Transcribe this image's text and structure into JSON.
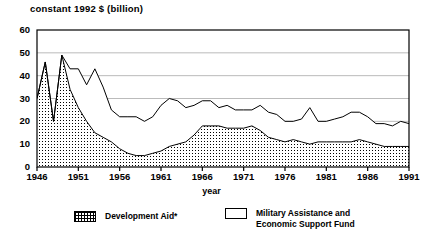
{
  "chart_data": {
    "type": "area",
    "title": "constant 1992 $ (billion)",
    "xlabel": "year",
    "ylabel": "",
    "stacked": true,
    "grid": true,
    "grid_axis": "y",
    "legend_position": "bottom",
    "xlim": [
      1946,
      1991
    ],
    "ylim": [
      0,
      60
    ],
    "yticks": [
      0,
      10,
      20,
      30,
      40,
      50,
      60
    ],
    "xticks": [
      1946,
      1951,
      1956,
      1961,
      1966,
      1971,
      1976,
      1981,
      1986,
      1991
    ],
    "x": [
      1946,
      1947,
      1948,
      1949,
      1950,
      1951,
      1952,
      1953,
      1954,
      1955,
      1956,
      1957,
      1958,
      1959,
      1960,
      1961,
      1962,
      1963,
      1964,
      1965,
      1966,
      1967,
      1968,
      1969,
      1970,
      1971,
      1972,
      1973,
      1974,
      1975,
      1976,
      1977,
      1978,
      1979,
      1980,
      1981,
      1982,
      1983,
      1984,
      1985,
      1986,
      1987,
      1988,
      1989,
      1990,
      1991
    ],
    "series": [
      {
        "name": "Development Aid*",
        "fill": "dotted",
        "values": [
          30,
          46,
          20,
          49,
          34,
          26,
          20,
          15,
          13,
          11,
          8,
          6,
          5,
          5,
          6,
          7,
          9,
          10,
          11,
          14,
          18,
          18,
          18,
          17,
          17,
          17,
          18,
          16,
          13,
          12,
          11,
          12,
          11,
          10,
          11,
          11,
          11,
          11,
          11,
          12,
          11,
          10,
          9,
          9,
          9,
          9
        ]
      },
      {
        "name": "Military Assistance and\nEconomic Support Fund",
        "fill": "plain",
        "values": [
          0,
          0,
          0,
          0,
          9,
          17,
          16,
          28,
          22,
          14,
          14,
          16,
          17,
          15,
          16,
          20,
          21,
          19,
          15,
          13,
          11,
          11,
          8,
          10,
          8,
          8,
          7,
          11,
          11,
          11,
          9,
          8,
          10,
          16,
          9,
          9,
          10,
          11,
          13,
          12,
          11,
          9,
          10,
          9,
          11,
          10
        ]
      }
    ],
    "total": [
      30,
      46,
      20,
      49,
      43,
      43,
      36,
      43,
      35,
      25,
      22,
      22,
      22,
      20,
      22,
      27,
      30,
      29,
      26,
      27,
      29,
      29,
      26,
      27,
      25,
      25,
      25,
      27,
      24,
      23,
      20,
      20,
      21,
      26,
      20,
      20,
      21,
      22,
      24,
      24,
      22,
      19,
      19,
      18,
      20,
      19
    ]
  },
  "axis": {
    "y_labels": [
      "60",
      "50",
      "40",
      "30",
      "20",
      "10",
      "0"
    ],
    "x_labels": [
      "1946",
      "1951",
      "1956",
      "1961",
      "1966",
      "1971",
      "1976",
      "1981",
      "1986",
      "1991"
    ],
    "x_title": "year"
  },
  "legend": {
    "items": [
      {
        "label": "Development Aid*",
        "swatch": "dotted"
      },
      {
        "label": "Military Assistance and\nEconomic Support Fund",
        "swatch": "plain"
      }
    ]
  },
  "colors": {
    "line": "#000000",
    "grid": "#aaaaaa",
    "background": "#ffffff",
    "fill_pattern": "#000000"
  }
}
